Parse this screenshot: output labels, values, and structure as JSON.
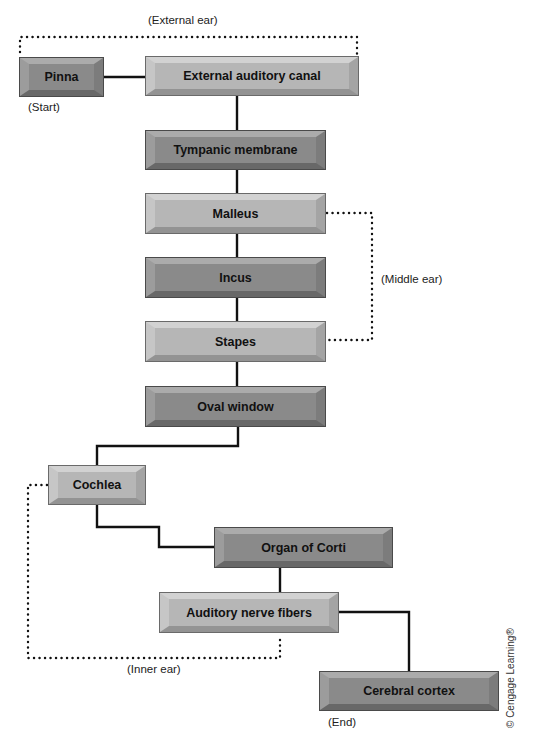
{
  "diagram": {
    "type": "flowchart",
    "nodes": [
      {
        "id": "pinna",
        "label": "Pinna",
        "shade": "dark",
        "x": 20,
        "y": 58,
        "w": 83,
        "h": 38
      },
      {
        "id": "external_auditory_canal",
        "label": "External auditory canal",
        "shade": "light",
        "x": 146,
        "y": 57,
        "w": 212,
        "h": 38
      },
      {
        "id": "tympanic_membrane",
        "label": "Tympanic membrane",
        "shade": "dark",
        "x": 146,
        "y": 131,
        "w": 179,
        "h": 38
      },
      {
        "id": "malleus",
        "label": "Malleus",
        "shade": "light",
        "x": 146,
        "y": 194,
        "w": 179,
        "h": 39
      },
      {
        "id": "incus",
        "label": "Incus",
        "shade": "dark",
        "x": 146,
        "y": 258,
        "w": 179,
        "h": 39
      },
      {
        "id": "stapes",
        "label": "Stapes",
        "shade": "light",
        "x": 146,
        "y": 322,
        "w": 179,
        "h": 39
      },
      {
        "id": "oval_window",
        "label": "Oval window",
        "shade": "dark",
        "x": 146,
        "y": 387,
        "w": 179,
        "h": 39
      },
      {
        "id": "cochlea",
        "label": "Cochlea",
        "shade": "light",
        "x": 49,
        "y": 466,
        "w": 96,
        "h": 38
      },
      {
        "id": "organ_of_corti",
        "label": "Organ of Corti",
        "shade": "dark",
        "x": 215,
        "y": 528,
        "w": 177,
        "h": 39
      },
      {
        "id": "auditory_nerve_fibers",
        "label": "Auditory nerve fibers",
        "shade": "light",
        "x": 160,
        "y": 593,
        "w": 178,
        "h": 39
      },
      {
        "id": "cerebral_cortex",
        "label": "Cerebral cortex",
        "shade": "dark",
        "x": 320,
        "y": 672,
        "w": 178,
        "h": 38
      }
    ],
    "edges": [
      {
        "from": "pinna",
        "to": "external_auditory_canal",
        "points": "103,77 146,77"
      },
      {
        "from": "external_auditory_canal",
        "to": "tympanic_membrane",
        "points": "237,95 237,131"
      },
      {
        "from": "tympanic_membrane",
        "to": "malleus",
        "points": "237,169 237,194"
      },
      {
        "from": "malleus",
        "to": "incus",
        "points": "237,233 237,258"
      },
      {
        "from": "incus",
        "to": "stapes",
        "points": "237,297 237,322"
      },
      {
        "from": "stapes",
        "to": "oval_window",
        "points": "237,361 237,387"
      },
      {
        "from": "oval_window",
        "to": "cochlea",
        "points": "238,426 238,446 97,446 97,466"
      },
      {
        "from": "cochlea",
        "to": "organ_of_corti",
        "points": "97,504 97,527 159,527 159,547 215,547"
      },
      {
        "from": "organ_of_corti",
        "to": "auditory_nerve_fibers",
        "points": "280,567 280,593"
      },
      {
        "from": "auditory_nerve_fibers",
        "to": "cerebral_cortex",
        "points": "338,612 409,612 409,672"
      }
    ],
    "groups": [
      {
        "id": "external_ear",
        "label": "(External ear)",
        "label_x": 148,
        "label_y": 14,
        "bracket": "20,52 20,37 357,37 357,54"
      },
      {
        "id": "middle_ear",
        "label": "(Middle ear)",
        "label_x": 381,
        "label_y": 273,
        "bracket": "327,213 372,213 372,340 327,340"
      },
      {
        "id": "inner_ear",
        "label": "(Inner ear)",
        "label_x": 127,
        "label_y": 663,
        "bracket": "47,485 28,485 28,658 280,658 280,636"
      }
    ],
    "annotations": [
      {
        "id": "start",
        "text": "(Start)",
        "x": 28,
        "y": 101
      },
      {
        "id": "end",
        "text": "(End)",
        "x": 328,
        "y": 716
      }
    ],
    "copyright": "© Cengage Learning®",
    "colors": {
      "line": "#111111",
      "dotted": "#111111",
      "light_face": "#b6b6b6",
      "dark_face": "#8a8a8a",
      "text": "#111111"
    }
  }
}
